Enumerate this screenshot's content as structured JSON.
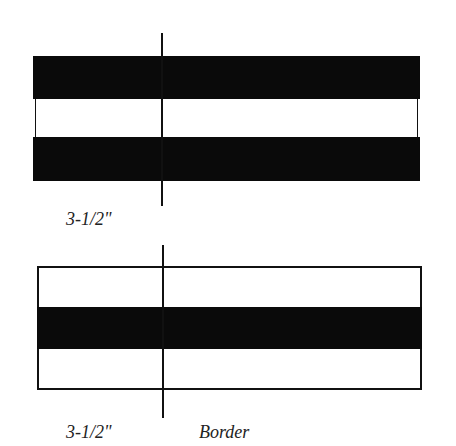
{
  "figures": [
    {
      "name": "top-strip",
      "bands": [
        "black",
        "white",
        "black"
      ],
      "measure_label": "3-1/2\""
    },
    {
      "name": "bottom-strip",
      "bands": [
        "white",
        "black",
        "white"
      ],
      "measure_label": "3-1/2\"",
      "side_label": "Border"
    }
  ],
  "colors": {
    "dark": "#0a0a0a",
    "light": "#ffffff",
    "outline": "#111111"
  }
}
